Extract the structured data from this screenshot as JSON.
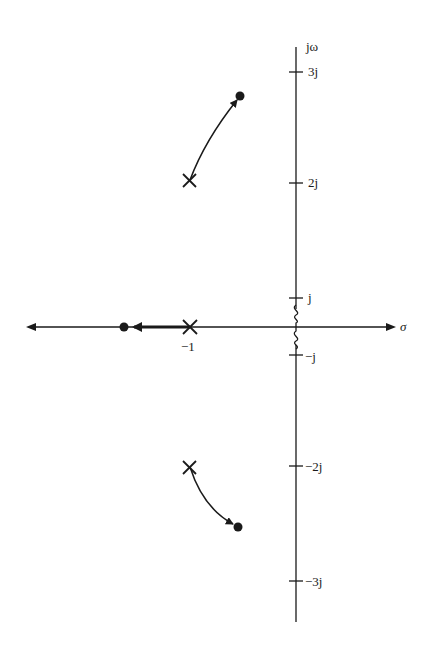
{
  "diagram": {
    "type": "root-locus",
    "axes": {
      "real_axis_label": "σ",
      "imag_axis_label": "jω"
    },
    "imag_ticks": [
      {
        "label": "3j",
        "value": 3
      },
      {
        "label": "2j",
        "value": 2
      },
      {
        "label": "j",
        "value": 1
      },
      {
        "label": "−j",
        "value": -1
      },
      {
        "label": "−2j",
        "value": -2
      },
      {
        "label": "−3j",
        "value": -3
      }
    ],
    "real_ticks": [
      {
        "label": "−1",
        "value": -1
      }
    ],
    "poles": [
      {
        "re": -1,
        "im": 2
      },
      {
        "re": -1,
        "im": 0
      },
      {
        "re": -1,
        "im": -2
      }
    ],
    "zeros": [
      {
        "re": -1.75,
        "im": 0
      },
      {
        "re": -0.55,
        "im": 2.5
      },
      {
        "re": -0.55,
        "im": -2.5
      }
    ],
    "branches": [
      {
        "from": "pole (-1, 2j)",
        "to": "zero (-0.55, 2.5j)"
      },
      {
        "from": "pole (-1, 0)",
        "to": "zero (-1.75, 0)"
      },
      {
        "from": "pole (-1, -2j)",
        "to": "zero (-0.55, -2.5j)"
      }
    ],
    "axis_break_marks": [
      "between 0 and j",
      "between 0 and -j"
    ]
  }
}
